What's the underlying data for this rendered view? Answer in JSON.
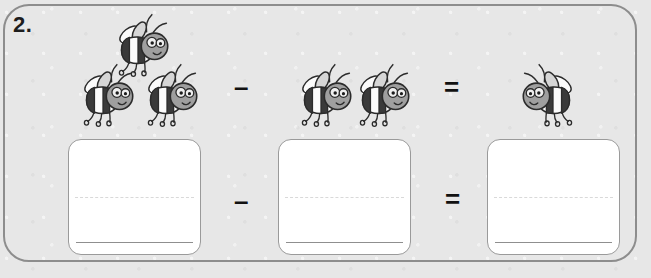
{
  "worksheet": {
    "question_number": "2.",
    "background_color": "#e7e7e7",
    "panel_border_color": "#8d8d8d",
    "equation_type": "subtraction",
    "operators": {
      "minus": "–",
      "equals": "="
    },
    "picture_row": {
      "left_group": {
        "label": "minuend-bees",
        "count": 3,
        "icon": "bee-icon",
        "facing": "right"
      },
      "operator_1": "–",
      "middle_group": {
        "label": "subtrahend-bees",
        "count": 2,
        "icon": "bee-icon",
        "facing": "right"
      },
      "operator_2": "=",
      "right_group": {
        "label": "result-bees",
        "count": 1,
        "icon": "bee-icon",
        "facing": "left"
      }
    },
    "answer_row": {
      "boxes": [
        {
          "name": "minuend-answer-box",
          "value": "",
          "placeholder": ""
        },
        {
          "name": "subtrahend-answer-box",
          "value": "",
          "placeholder": ""
        },
        {
          "name": "result-answer-box",
          "value": "",
          "placeholder": ""
        }
      ],
      "operator_1": "–",
      "operator_2": "="
    }
  }
}
